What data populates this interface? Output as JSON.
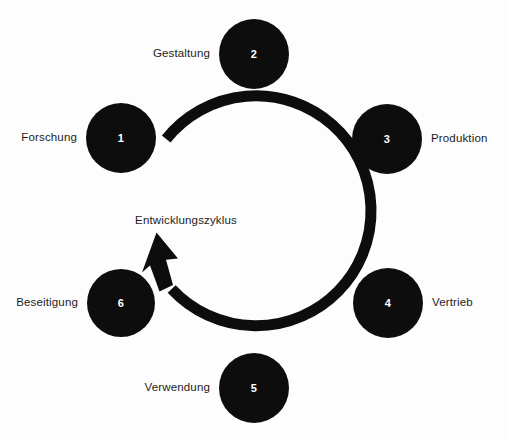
{
  "diagram": {
    "type": "cycle-diagram",
    "title": "Entwicklungszyklus",
    "center_label": "Entwicklungszyklus",
    "background_color": "#fdfdfd",
    "node_color": "#0d0d0d",
    "node_number_color": "#ffffff",
    "label_color": "#1c1c1c",
    "arrow": {
      "name": "cycle-arrow",
      "direction": "clockwise",
      "stroke_color": "#0d0d0d",
      "stroke_width": 11,
      "radius": 115,
      "center_x": 254,
      "center_y": 221,
      "gap_side": "left"
    },
    "nodes": [
      {
        "number": "1",
        "label": "Forschung",
        "label_side": "left",
        "cx": 121,
        "cy": 138,
        "r": 35
      },
      {
        "number": "2",
        "label": "Gestaltung",
        "label_side": "left",
        "cx": 254,
        "cy": 54,
        "r": 35
      },
      {
        "number": "3",
        "label": "Produktion",
        "label_side": "right",
        "cx": 387,
        "cy": 139,
        "r": 35
      },
      {
        "number": "4",
        "label": "Vertrieb",
        "label_side": "right",
        "cx": 388,
        "cy": 303,
        "r": 35
      },
      {
        "number": "5",
        "label": "Verwendung",
        "label_side": "left",
        "cx": 254,
        "cy": 388,
        "r": 35
      },
      {
        "number": "6",
        "label": "Beseitigung",
        "label_side": "left",
        "cx": 121,
        "cy": 303,
        "r": 34
      }
    ],
    "center_label_x": 186,
    "center_label_y": 221
  }
}
